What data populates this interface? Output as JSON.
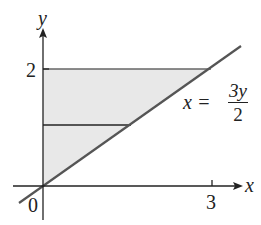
{
  "diagram": {
    "axes": {
      "x_label": "x",
      "y_label": "y",
      "origin_label": "0",
      "x_tick_label": "3",
      "y_tick_label": "2"
    },
    "curve": {
      "equation_lhs": "x =",
      "equation_num": "3y",
      "equation_den": "2"
    },
    "region": {
      "description": "Shaded region bounded by y-axis, y = 2, and x = 3y/2, with a horizontal strip",
      "fill_color": "#e6e6e6",
      "line_color": "#555555"
    }
  }
}
